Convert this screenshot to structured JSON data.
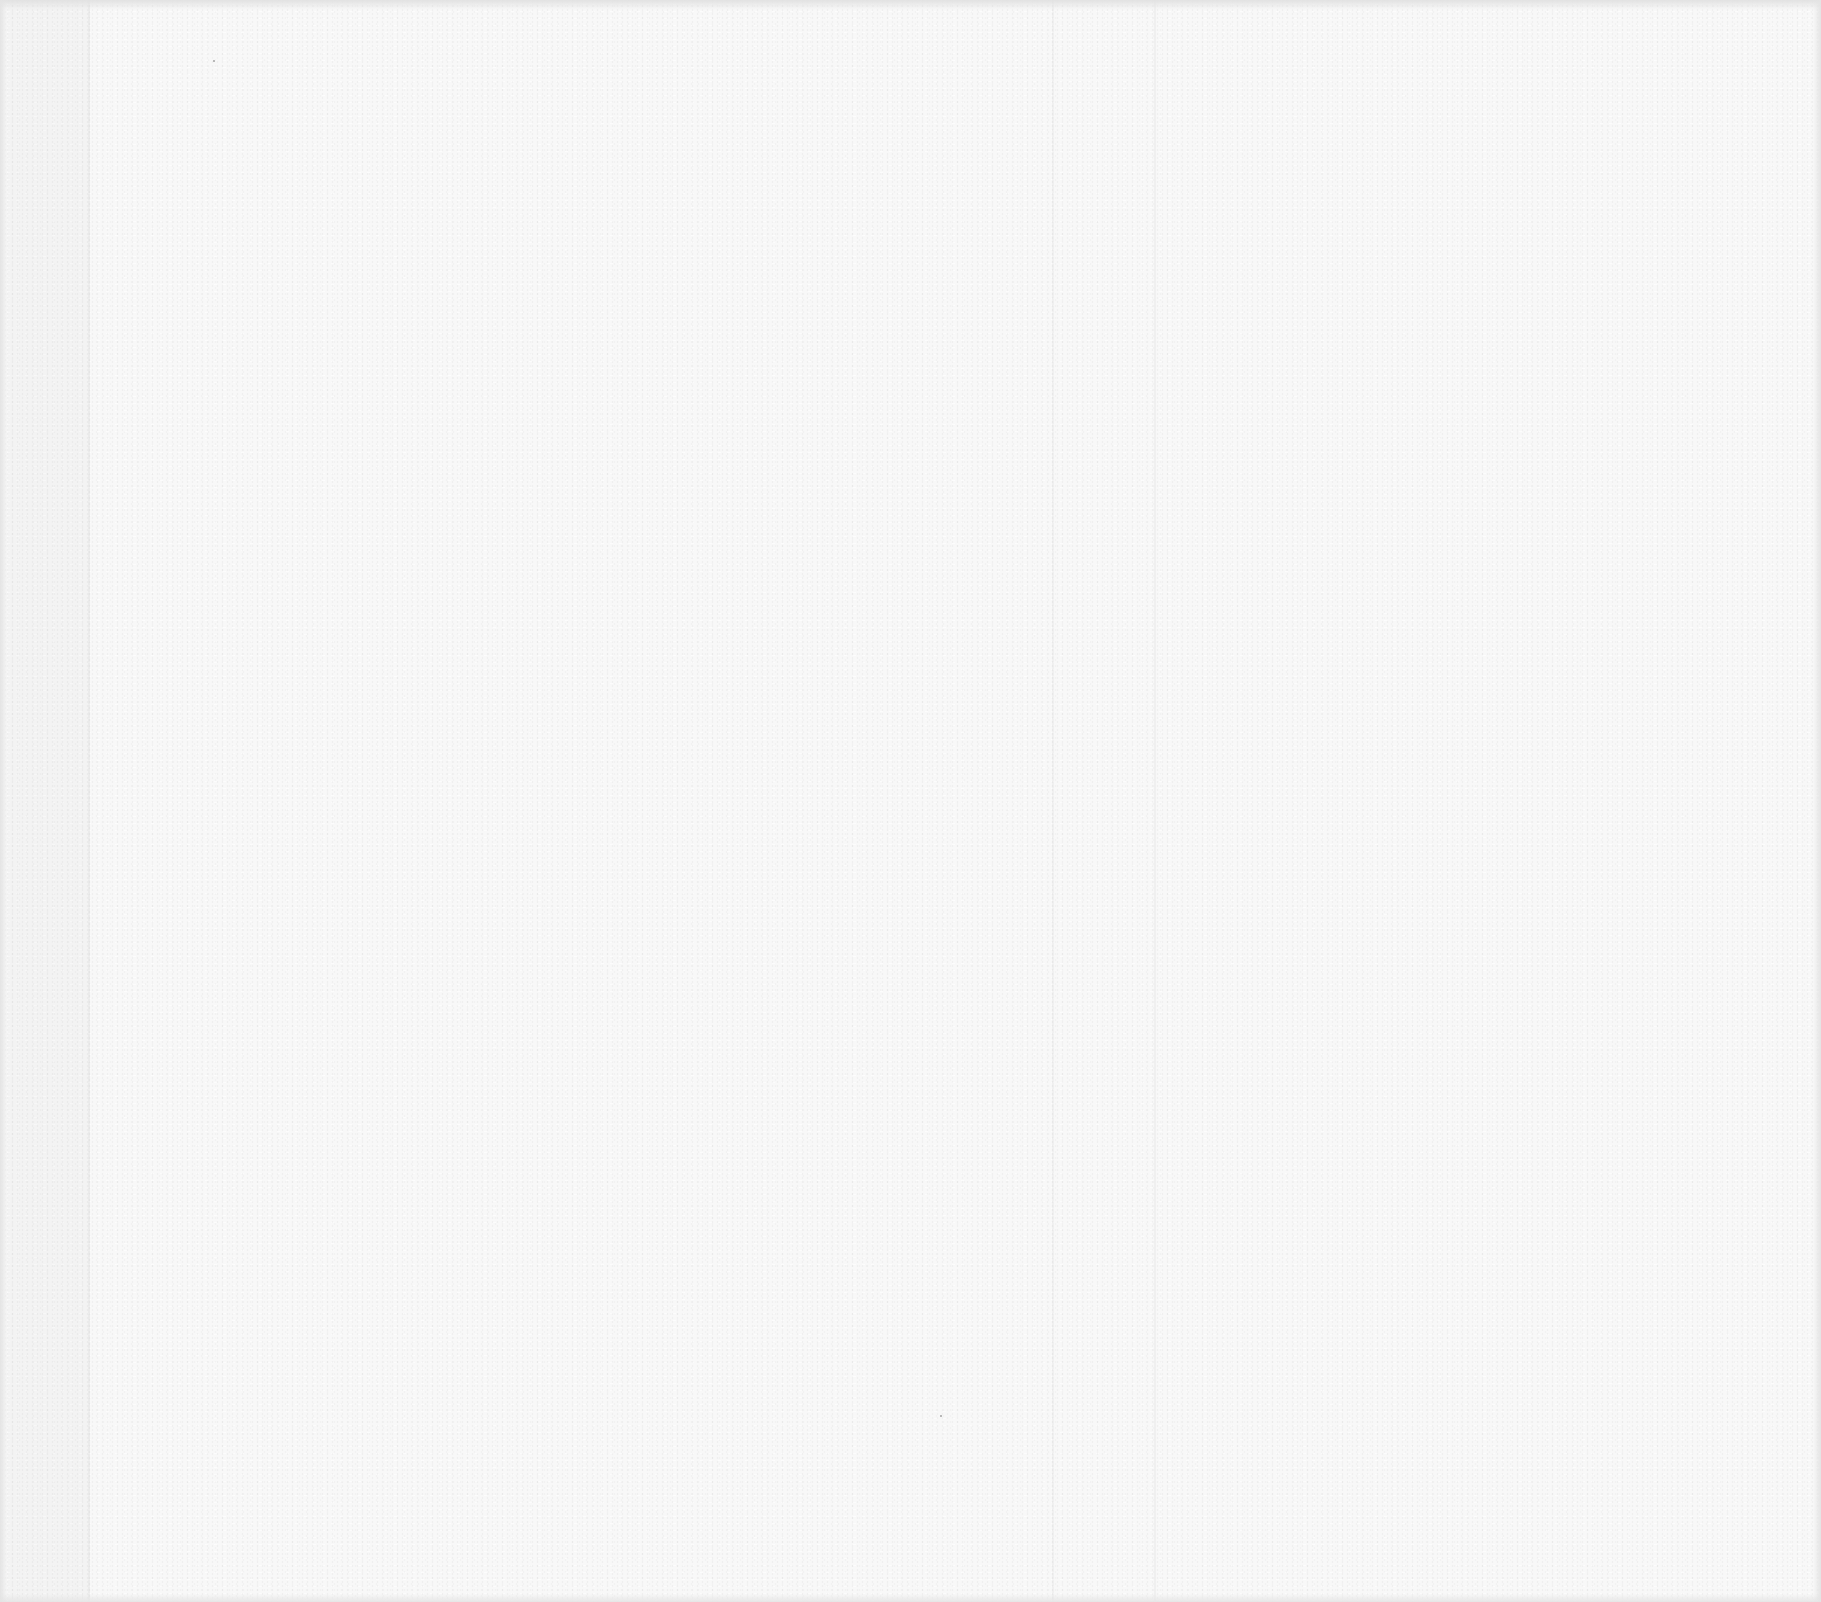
{
  "page": {
    "type": "blank-paper-sheet",
    "content_text": "",
    "background_color": "#f8f8f8",
    "edge_shadow_color": "#e2e2e2"
  }
}
